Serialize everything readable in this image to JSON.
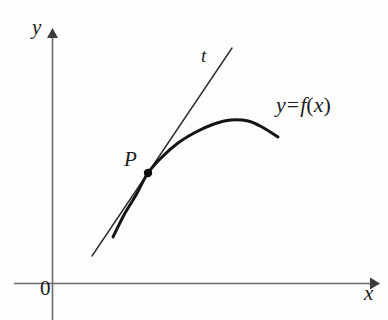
{
  "figure": {
    "background_color": "#fdfdfd",
    "ink_color": "#1d1d1d",
    "axis_color": "#6b6b6b"
  },
  "axes": {
    "y_label": "y",
    "x_label": "x",
    "origin_label": "0",
    "origin_px": {
      "x": 52,
      "y": 283
    },
    "x_axis": {
      "x_start": 14,
      "x_end": 377,
      "y": 283,
      "arrow": "right"
    },
    "y_axis": {
      "x": 52,
      "y_start": 30,
      "y_end": 320,
      "arrow": "up"
    }
  },
  "labels": {
    "point": "P",
    "tangent": "t",
    "function_y": "y",
    "function_equals": "=",
    "function_f": "f",
    "function_open_paren": "(",
    "function_var": "x",
    "function_close_paren": ")"
  },
  "chart_data": {
    "type": "line",
    "xlabel": "x",
    "ylabel": "y",
    "grid": false,
    "legend": "none",
    "annotations": [
      {
        "name": "point-label",
        "text": "P",
        "x": 126,
        "y": 166
      },
      {
        "name": "tangent-label",
        "text": "t",
        "x": 203,
        "y": 62
      },
      {
        "name": "function-label",
        "text": "y = f(x)",
        "x": 278,
        "y": 112
      },
      {
        "name": "origin-label",
        "text": "0",
        "x": 42,
        "y": 295
      },
      {
        "name": "x-axis-label",
        "text": "x",
        "x": 366,
        "y": 300
      },
      {
        "name": "y-axis-label",
        "text": "y",
        "x": 34,
        "y": 34
      }
    ],
    "series": [
      {
        "name": "curve",
        "label": "y = f(x)",
        "stroke_width": 3,
        "points_px": [
          [
            113,
            237
          ],
          [
            124,
            215
          ],
          [
            136,
            195
          ],
          [
            148,
            173
          ],
          [
            162,
            157
          ],
          [
            178,
            143
          ],
          [
            196,
            132
          ],
          [
            214,
            124
          ],
          [
            231,
            120
          ],
          [
            248,
            121
          ],
          [
            262,
            127
          ],
          [
            278,
            137
          ]
        ]
      },
      {
        "name": "tangent-line",
        "label": "t",
        "stroke_width": 1.4,
        "points_px": [
          [
            92,
            256
          ],
          [
            232,
            48
          ]
        ]
      }
    ],
    "markers": [
      {
        "name": "point-P",
        "x": 148,
        "y": 173,
        "radius": 4.2,
        "filled": true
      }
    ]
  }
}
